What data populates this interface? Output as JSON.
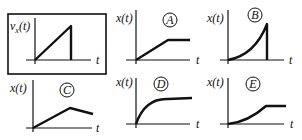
{
  "given": {
    "ylabel": "v",
    "ylabel_sub": "x",
    "ylabel_arg": "(t)",
    "xlabel": "t",
    "description": "velocity increases linearly then drops to zero"
  },
  "options": [
    {
      "letter": "A",
      "ylabel": "x(t)",
      "xlabel": "t",
      "description": "linear rise then flat"
    },
    {
      "letter": "B",
      "ylabel": "x(t)",
      "xlabel": "t",
      "description": "concave-up rise then vertical drop"
    },
    {
      "letter": "C",
      "ylabel": "x(t)",
      "xlabel": "t",
      "description": "linear rise then linear decrease"
    },
    {
      "letter": "D",
      "ylabel": "x(t)",
      "xlabel": "t",
      "description": "concave-down rise approaching plateau"
    },
    {
      "letter": "E",
      "ylabel": "x(t)",
      "xlabel": "t",
      "description": "concave-up rise then flat"
    }
  ]
}
